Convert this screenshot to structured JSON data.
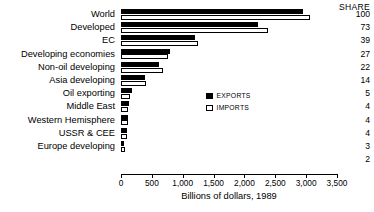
{
  "chart_data": {
    "type": "bar",
    "orientation": "horizontal",
    "title": "",
    "xlabel": "Billions of dollars, 1989",
    "ylabel": "",
    "xlim": [
      0,
      3500
    ],
    "xticks": [
      0,
      500,
      1000,
      1500,
      2000,
      2500,
      3000,
      3500
    ],
    "xtick_labels": [
      "0",
      "500",
      "1,000",
      "1,500",
      "2,000",
      "2,500",
      "3,000",
      "3,500"
    ],
    "grid": false,
    "legend_position": "center-right",
    "categories": [
      "World",
      "Developed",
      "EC",
      "Developing economies",
      "Non-oil developing",
      "Asia developing",
      "Oil exporting",
      "Middle East",
      "Western Hemisphere",
      "USSR & CEE",
      "Europe developing"
    ],
    "series": [
      {
        "name": "EXPORTS",
        "color": "#000000",
        "values": [
          2950,
          2220,
          1200,
          800,
          620,
          390,
          180,
          130,
          120,
          100,
          55
        ]
      },
      {
        "name": "IMPORTS",
        "color": "#ffffff",
        "values": [
          3060,
          2380,
          1250,
          760,
          680,
          400,
          140,
          120,
          115,
          95,
          60
        ]
      }
    ],
    "share_header": "SHARE",
    "share_values": [
      100,
      73,
      39,
      27,
      22,
      14,
      5,
      4,
      4,
      4,
      3,
      2
    ]
  }
}
